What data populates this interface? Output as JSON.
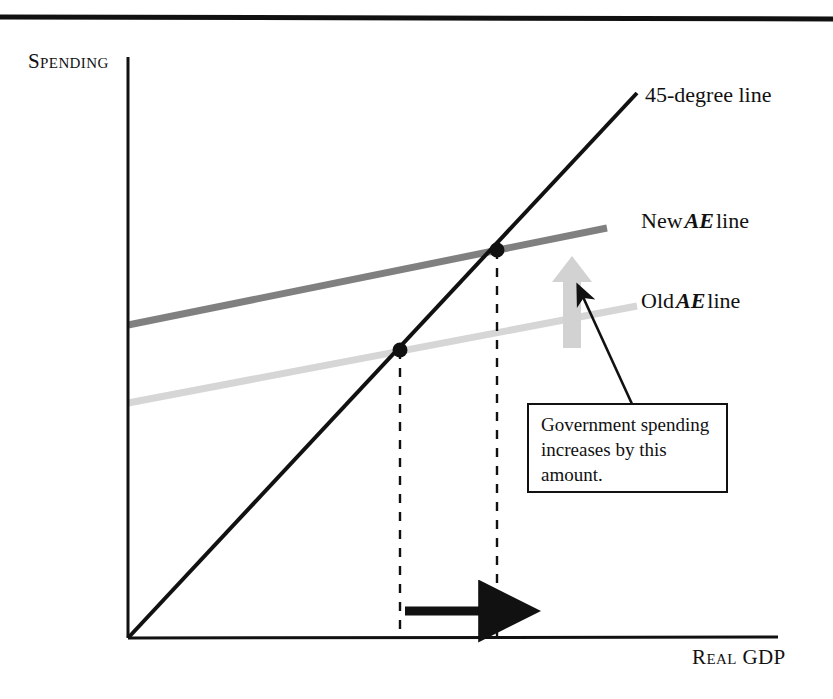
{
  "figure": {
    "domain": "economics-diagram",
    "background_color": "#ffffff",
    "top_rule": {
      "color": "#111111",
      "y": 17,
      "thickness": 5
    },
    "axes": {
      "y_axis_label": "Spending",
      "x_axis_label": "Real GDP",
      "origin": {
        "x": 128,
        "y": 638
      },
      "y_axis_top": 57,
      "x_axis_right": 778,
      "color": "#111111"
    },
    "series": [
      {
        "name": "45-degree line",
        "label": "45-degree line",
        "color": "#111111",
        "thickness": 4,
        "from": {
          "x": 128,
          "y": 638
        },
        "to": {
          "x": 637,
          "y": 93
        }
      },
      {
        "name": "new-ae-line",
        "label_prefix": "New",
        "label_emphasis": "AE",
        "label_suffix": "line",
        "color": "#808080",
        "thickness": 7,
        "from": {
          "x": 128,
          "y": 325
        },
        "to": {
          "x": 607,
          "y": 228
        }
      },
      {
        "name": "old-ae-line",
        "label_prefix": "Old",
        "label_emphasis": "AE",
        "label_suffix": "line",
        "color": "#d6d6d6",
        "thickness": 7,
        "from": {
          "x": 128,
          "y": 403
        },
        "to": {
          "x": 637,
          "y": 306
        }
      }
    ],
    "equilibrium_points": [
      {
        "name": "old-equilibrium",
        "x": 400,
        "y": 350,
        "radius": 7,
        "color": "#111111"
      },
      {
        "name": "new-equilibrium",
        "x": 497,
        "y": 250,
        "radius": 7,
        "color": "#111111"
      }
    ],
    "dashed_guides": [
      {
        "name": "old-gdp-guide",
        "x": 400,
        "y_top": 350,
        "y_bottom": 638,
        "color": "#111111"
      },
      {
        "name": "new-gdp-guide",
        "x": 497,
        "y_top": 250,
        "y_bottom": 638,
        "color": "#111111"
      }
    ],
    "gdp_shift_arrow": {
      "name": "gdp-increase-arrow",
      "from_x": 405,
      "to_x": 500,
      "y": 611,
      "color": "#111111",
      "thickness": 9
    },
    "spending_shift_arrow": {
      "name": "spending-shift-arrow",
      "x": 572,
      "from_y": 348,
      "to_y": 256,
      "color": "#d2d2d2",
      "shaft_width": 18,
      "head_width": 40
    },
    "callout": {
      "text_lines": [
        "Government spending",
        "increases by this",
        "amount."
      ],
      "border_color": "#111111",
      "background": "#ffffff",
      "pointer": {
        "name": "callout-pointer",
        "from": {
          "x": 632,
          "y": 404
        },
        "to": {
          "x": 578,
          "y": 286
        },
        "color": "#111111"
      }
    }
  }
}
